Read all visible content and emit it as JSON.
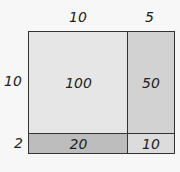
{
  "top_labels": [
    "10",
    "5"
  ],
  "side_labels": [
    "10",
    "2"
  ],
  "cells": {
    "top_left": {
      "value": "100",
      "color": "#e6e6e6"
    },
    "top_right": {
      "value": "50",
      "color": "#d2d2d2"
    },
    "bottom_left": {
      "value": "20",
      "color": "#bdbdbd"
    },
    "bottom_right": {
      "value": "10",
      "color": "#dcdcdc"
    }
  }
}
